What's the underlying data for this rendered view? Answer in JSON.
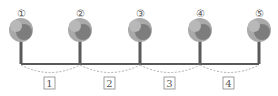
{
  "diagram": {
    "trees": [
      {
        "label": "①",
        "x": 21
      },
      {
        "label": "②",
        "x": 80
      },
      {
        "label": "③",
        "x": 140
      },
      {
        "label": "④",
        "x": 200
      },
      {
        "label": "⑤",
        "x": 259
      }
    ],
    "intervals": [
      {
        "label": "1",
        "x": 50
      },
      {
        "label": "2",
        "x": 110
      },
      {
        "label": "3",
        "x": 170
      },
      {
        "label": "4",
        "x": 229
      }
    ],
    "colors": {
      "foliage_light": "#a9a9a9",
      "foliage_dark": "#7d7d7d",
      "trunk": "#5a5a5a",
      "ground": "#222222",
      "dashes": "#999999"
    }
  }
}
